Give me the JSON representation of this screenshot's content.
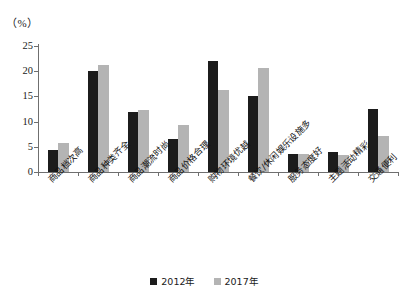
{
  "chart_data": {
    "type": "bar",
    "title": "",
    "subtitle": "",
    "unit_label": "（%）",
    "xlabel": "",
    "ylabel": "",
    "ylim": [
      0,
      25
    ],
    "ytick_interval": 5,
    "yticks": [
      "0",
      "5",
      "10",
      "15",
      "20",
      "25"
    ],
    "grid": false,
    "legend_position": "bottom-center",
    "categories": [
      "商品档次高",
      "商品种类齐全",
      "商品潮流时尚",
      "商品价格合理",
      "购物环境优越",
      "餐饮/休闲娱乐设施多",
      "服务态度好",
      "主题活动精彩",
      "交通便利"
    ],
    "series": [
      {
        "name": "2012年",
        "color": "#1c1c1c",
        "values": [
          4.3,
          20.1,
          12.0,
          6.5,
          22.0,
          15.0,
          3.6,
          4.0,
          12.5
        ]
      },
      {
        "name": "2017年",
        "color": "#b4b4b4",
        "values": [
          5.7,
          21.2,
          12.3,
          9.4,
          16.3,
          20.7,
          3.6,
          3.4,
          7.2
        ]
      }
    ]
  },
  "legend": {
    "items": [
      {
        "label": "2012年",
        "swatch": "dark-square-swatch"
      },
      {
        "label": "2017年",
        "swatch": "light-square-swatch"
      }
    ]
  },
  "colors": {
    "series_2012": "#1c1c1c",
    "series_2017": "#b4b4b4",
    "axis": "#6f6f6f",
    "text": "#1a1a1a",
    "background": "#ffffff"
  }
}
